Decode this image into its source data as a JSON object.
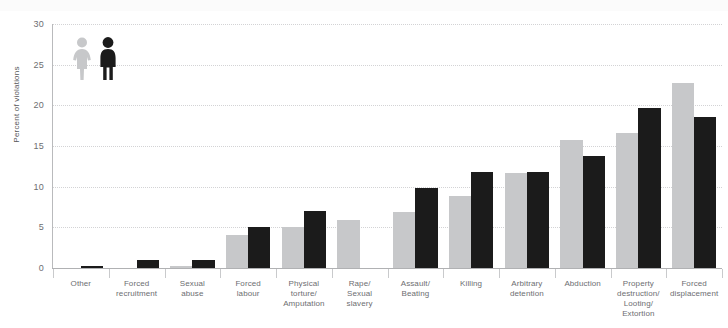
{
  "chart_data": {
    "type": "bar",
    "title": "",
    "xlabel": "",
    "ylabel": "Percent of violations",
    "ylim": [
      0,
      30
    ],
    "yticks": [
      0,
      5,
      10,
      15,
      20,
      25,
      30
    ],
    "grid": true,
    "legend_position": "top-left",
    "categories": [
      "Other",
      "Forced recruitment",
      "Sexual abuse",
      "Forced labour",
      "Physical torture/ Amputation",
      "Rape/ Sexual slavery",
      "Assault/ Beating",
      "Killing",
      "Arbitrary detention",
      "Abduction",
      "Property destruction/ Looting/ Extortion",
      "Forced displacement"
    ],
    "category_lines": [
      [
        "Other"
      ],
      [
        "Forced",
        "recruitment"
      ],
      [
        "Sexual",
        "abuse"
      ],
      [
        "Forced",
        "labour"
      ],
      [
        "Physical",
        "torture/",
        "Amputation"
      ],
      [
        "Rape/",
        "Sexual",
        "slavery"
      ],
      [
        "Assault/",
        "Beating"
      ],
      [
        "Killing"
      ],
      [
        "Arbitrary",
        "detention"
      ],
      [
        "Abduction"
      ],
      [
        "Property",
        "destruction/",
        "Looting/",
        "Extortion"
      ],
      [
        "Forced",
        "displacement"
      ]
    ],
    "series": [
      {
        "name": "Female",
        "color": "#c7c8ca",
        "icon": "female-pictogram",
        "values": [
          0.0,
          0.0,
          0.3,
          4.0,
          5.0,
          5.9,
          6.9,
          8.9,
          11.7,
          15.7,
          16.6,
          22.7
        ]
      },
      {
        "name": "Male",
        "color": "#1b1b1b",
        "icon": "male-pictogram",
        "values": [
          0.2,
          1.0,
          1.0,
          5.0,
          7.0,
          0.0,
          9.8,
          11.8,
          11.8,
          13.8,
          19.7,
          18.6
        ]
      }
    ]
  }
}
